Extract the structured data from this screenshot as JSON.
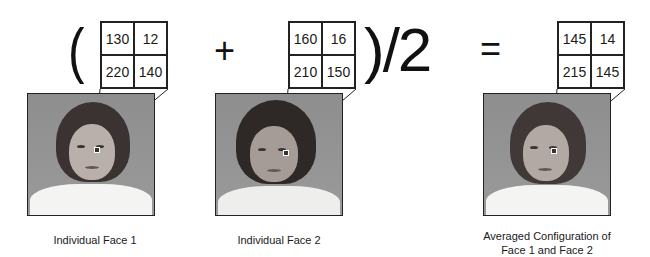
{
  "equation": {
    "open_paren": "(",
    "plus": "+",
    "close_divide": ")/2",
    "equals": "="
  },
  "faces": [
    {
      "caption": [
        "Individual Face 1",
        ""
      ],
      "pixel_grid": [
        [
          "130",
          "12"
        ],
        [
          "220",
          "140"
        ]
      ]
    },
    {
      "caption": [
        "Individual Face 2",
        ""
      ],
      "pixel_grid": [
        [
          "160",
          "16"
        ],
        [
          "210",
          "150"
        ]
      ]
    },
    {
      "caption": [
        "Averaged Configuration of",
        "Face 1 and Face 2"
      ],
      "pixel_grid": [
        [
          "145",
          "14"
        ],
        [
          "215",
          "145"
        ]
      ]
    }
  ]
}
